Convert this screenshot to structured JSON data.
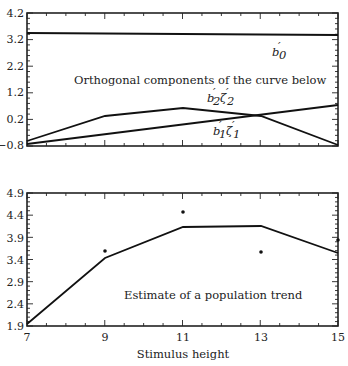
{
  "chart_data": [
    {
      "type": "line",
      "title": "Orthogonal components of the curve below",
      "xlabel": "",
      "ylabel": "",
      "ylim": [
        -0.8,
        4.2
      ],
      "xlim": [
        7,
        15
      ],
      "yticks": [
        "4.2",
        "3.2",
        "2.2",
        "1.2",
        "0.2",
        "-0.8"
      ],
      "x": [
        7,
        9,
        11,
        13,
        15
      ],
      "series": [
        {
          "name": "b0'",
          "values": [
            3.45,
            3.43,
            3.4,
            3.38,
            3.35
          ]
        },
        {
          "name": "b2' ζ2'",
          "values": [
            -0.7,
            0.3,
            0.6,
            0.3,
            -0.75
          ]
        },
        {
          "name": "b1' ζ1'",
          "values": [
            -0.75,
            -0.4,
            -0.05,
            0.3,
            0.65
          ]
        }
      ],
      "annotations": [
        "b0'",
        "b2' ζ2'",
        "b1' ζ1'"
      ]
    },
    {
      "type": "line",
      "title": "Estimate of a population trend",
      "xlabel": "Stimulus height",
      "ylabel": "",
      "ylim": [
        1.9,
        4.9
      ],
      "xlim": [
        7,
        15
      ],
      "yticks": [
        "4.9",
        "4.4",
        "3.9",
        "3.4",
        "2.9",
        "2.4",
        "1.9"
      ],
      "xticks": [
        "7",
        "9",
        "11",
        "13",
        "15"
      ],
      "x": [
        7,
        9,
        11,
        13,
        15
      ],
      "series": [
        {
          "name": "trend",
          "values": [
            1.95,
            3.4,
            4.1,
            4.12,
            3.5
          ]
        },
        {
          "name": "observed",
          "type": "scatter",
          "x": [
            9,
            11,
            13,
            15
          ],
          "values": [
            3.55,
            4.42,
            3.52,
            3.78
          ]
        }
      ]
    }
  ],
  "labels": {
    "top_caption": "Orthogonal components of the curve below",
    "bottom_caption": "Estimate of a population trend",
    "xlabel": "Stimulus height",
    "b0": "b",
    "b0_sub": "0",
    "b2": "b",
    "b2_sub": "2",
    "zeta2": "ζ",
    "zeta2_sub": "2",
    "b1": "b",
    "b1_sub": "1",
    "zeta1": "ζ",
    "zeta1_sub": "1",
    "prime": "′"
  },
  "top_yticks": [
    "4.2",
    "3.2",
    "2.2",
    "1.2",
    "0.2",
    "−0.8"
  ],
  "bottom_yticks": [
    "4.9",
    "4.4",
    "3.9",
    "3.4",
    "2.9",
    "2.4",
    "1.9"
  ],
  "xticks": [
    "7",
    "9",
    "11",
    "13",
    "15"
  ]
}
